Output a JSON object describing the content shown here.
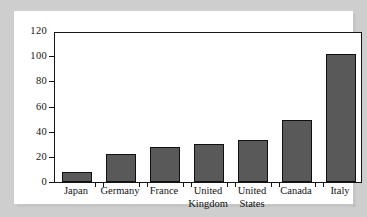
{
  "chart_data": {
    "type": "bar",
    "title": "",
    "subtitle": "",
    "xlabel": "",
    "ylabel": "",
    "categories": [
      "Japan",
      "Germany",
      "France",
      "United Kingdom",
      "United States",
      "Canada",
      "Italy"
    ],
    "category_lines": [
      [
        "Japan"
      ],
      [
        "Germany"
      ],
      [
        "France"
      ],
      [
        "United",
        "Kingdom"
      ],
      [
        "United",
        "States"
      ],
      [
        "Canada"
      ],
      [
        "Italy"
      ]
    ],
    "values": [
      8,
      22,
      28,
      30,
      33,
      49,
      102
    ],
    "ylim": [
      0,
      120
    ],
    "ytick_labels": [
      "0",
      "20",
      "40",
      "60",
      "80",
      "100",
      "120"
    ],
    "ytick_values": [
      0,
      20,
      40,
      60,
      80,
      100,
      120
    ],
    "grid": false,
    "legend": false,
    "legend_position": "none",
    "bar_fill_color": "#595959",
    "bar_border_color": "#101010",
    "axis_color": "#151515",
    "plot_background_color": "#ffffff",
    "page_background_color": "#cdcecd"
  }
}
